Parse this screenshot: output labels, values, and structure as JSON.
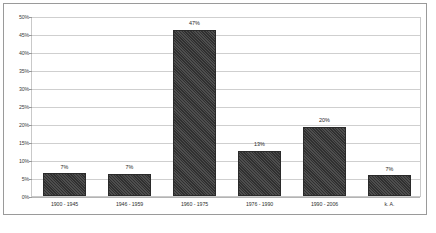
{
  "chart_data": {
    "type": "bar",
    "title": "",
    "subtitle": "",
    "xlabel": "",
    "ylabel": "",
    "categories": [
      "1900 - 1945",
      "1946 - 1959",
      "1960 - 1975",
      "1976 - 1990",
      "1990 - 2006",
      "k. A."
    ],
    "values": [
      7,
      7,
      47,
      13,
      20,
      7
    ],
    "data_labels": [
      "7%",
      "7%",
      "47%",
      "13%",
      "20%",
      "7%"
    ],
    "bar_heights_pct": [
      6.4,
      6.2,
      46.2,
      12.6,
      19.3,
      5.7
    ],
    "ylim": [
      0,
      50
    ],
    "ytick_step": 5,
    "ytick_labels": [
      "0%",
      "5%",
      "10%",
      "15%",
      "20%",
      "25%",
      "30%",
      "35%",
      "40%",
      "45%",
      "50%"
    ],
    "ytick_values": [
      0,
      5,
      10,
      15,
      20,
      25,
      30,
      35,
      40,
      45,
      50
    ],
    "grid": true,
    "grid_axis": "y",
    "legend": false,
    "legend_position": "none",
    "series_name": "",
    "colors": {
      "bar_fill": "#3a3a3a",
      "bar_border": "#2a2a2a",
      "gridline": "#cfcfcf",
      "baseline": "#b4b4b4",
      "plot_border": "#c9c9c9",
      "frame_border": "#9a9a9a",
      "background": "#ffffff",
      "tick_text": "#3c3c3c",
      "label_text": "#2e2e2e"
    }
  }
}
